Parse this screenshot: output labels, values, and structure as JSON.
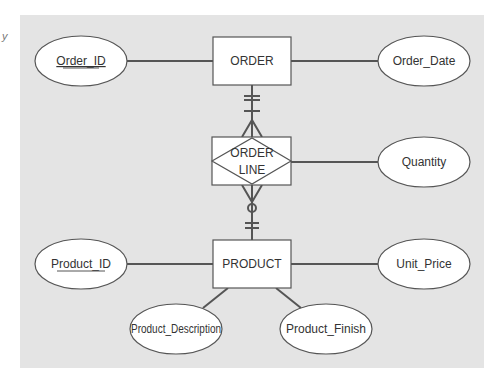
{
  "diagram": {
    "title": "",
    "margin_glyph": "y",
    "colors": {
      "panel": "#e4e4e4",
      "shape_fill": "#ffffff",
      "stroke": "#555555",
      "text": "#333333"
    },
    "entities": [
      {
        "id": "order",
        "label": "ORDER"
      },
      {
        "id": "product",
        "label": "PRODUCT"
      }
    ],
    "associative_entity": {
      "id": "order_line",
      "label_line1": "ORDER",
      "label_line2": "LINE"
    },
    "attributes": [
      {
        "id": "order_id",
        "label": "Order_ID",
        "owner": "ORDER",
        "identifier": true
      },
      {
        "id": "order_date",
        "label": "Order_Date",
        "owner": "ORDER",
        "identifier": false
      },
      {
        "id": "quantity",
        "label": "Quantity",
        "owner": "ORDER LINE",
        "identifier": false
      },
      {
        "id": "product_id",
        "label": "Product_ID",
        "owner": "PRODUCT",
        "identifier": true
      },
      {
        "id": "unit_price",
        "label": "Unit_Price",
        "owner": "PRODUCT",
        "identifier": false
      },
      {
        "id": "product_description",
        "label": "Product_Description",
        "owner": "PRODUCT",
        "identifier": false
      },
      {
        "id": "product_finish",
        "label": "Product_Finish",
        "owner": "PRODUCT",
        "identifier": false
      }
    ],
    "relationships": [
      {
        "from": "ORDER",
        "to": "ORDER LINE",
        "from_cardinality": "mandatory one",
        "to_cardinality": "many"
      },
      {
        "from": "PRODUCT",
        "to": "ORDER LINE",
        "from_cardinality": "mandatory one",
        "to_cardinality": "optional many"
      }
    ]
  }
}
